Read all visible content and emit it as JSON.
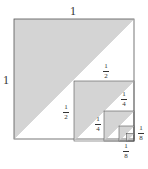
{
  "labels": {
    "top": "1",
    "left": "1",
    "half_top": {
      "num": "1",
      "den": "2"
    },
    "half_left": {
      "num": "1",
      "den": "2"
    },
    "quarter_top": {
      "num": "1",
      "den": "4"
    },
    "quarter_left": {
      "num": "1",
      "den": "4"
    },
    "eighth_right": {
      "num": "1",
      "den": "8"
    },
    "eighth_bottom": {
      "num": "1",
      "den": "8"
    }
  },
  "colors": {
    "shade": "#d4d4d4",
    "stroke": "#555555",
    "background": "#ffffff"
  },
  "squares": [
    {
      "x": 14,
      "y": 19,
      "size": 120
    },
    {
      "x": 74,
      "y": 81,
      "size": 60
    },
    {
      "x": 104,
      "y": 111,
      "size": 30
    },
    {
      "x": 119,
      "y": 126,
      "size": 15
    },
    {
      "x": 126.5,
      "y": 133.5,
      "size": 7.5
    }
  ]
}
